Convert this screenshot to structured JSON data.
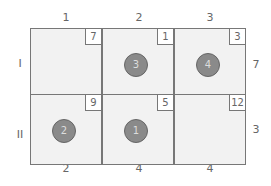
{
  "columns": [
    "1",
    "2",
    "3"
  ],
  "rows": [
    "I",
    "II"
  ],
  "supply": [
    "7",
    "3"
  ],
  "demand": [
    "2",
    "4",
    "4"
  ],
  "cells": [
    [
      {
        "cost": "7",
        "order": ""
      },
      {
        "cost": "1",
        "order": "3"
      },
      {
        "cost": "3",
        "order": "4"
      }
    ],
    [
      {
        "cost": "9",
        "order": "2"
      },
      {
        "cost": "5",
        "order": "1"
      },
      {
        "cost": "12",
        "order": ""
      }
    ]
  ],
  "colors": {
    "cell_bg": "#f2f2f2",
    "border": "#777777",
    "circle": "#8a8a8a",
    "text": "#666666"
  }
}
